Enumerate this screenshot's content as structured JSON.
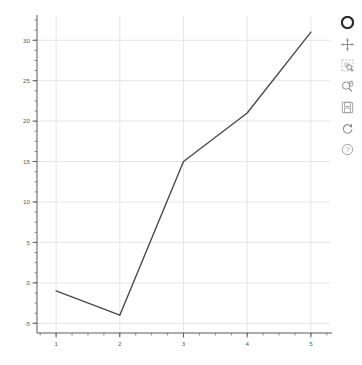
{
  "chart_data": {
    "type": "line",
    "title": "",
    "xlabel": "",
    "ylabel": "",
    "x": [
      1,
      2,
      3,
      4,
      5
    ],
    "values": [
      -1,
      -4,
      15,
      21,
      31
    ],
    "series": [
      {
        "name": "series-1",
        "values": [
          -1,
          -4,
          15,
          21,
          31
        ],
        "color": "#4a4a4a"
      }
    ],
    "xlim": [
      0.7,
      5.3
    ],
    "ylim": [
      -6.2,
      33.0
    ],
    "xticks": [
      1,
      2,
      3,
      4,
      5
    ],
    "xtick_labels": [
      "1",
      "2",
      "3",
      "4",
      "5"
    ],
    "yticks": [
      -5,
      0,
      5,
      10,
      15,
      20,
      25,
      30
    ],
    "ytick_labels": [
      "-5",
      "0",
      "5",
      "10",
      "15",
      "20",
      "25",
      "30"
    ],
    "x_minor_per_major": 4,
    "y_minor_per_major": 4,
    "grid": true,
    "grid_color": "#e5e5e5",
    "axis_color": "#5b5b5b",
    "background": "#ffffff",
    "legend": null,
    "legend_position": "none"
  },
  "toolbar": {
    "position": "right",
    "logo_name": "bokeh-logo",
    "tools": [
      {
        "name": "pan-tool",
        "label": "Pan",
        "icon": "move-cross-icon",
        "active": false
      },
      {
        "name": "box-zoom-tool",
        "label": "Box Zoom",
        "icon": "box-zoom-icon",
        "active": false
      },
      {
        "name": "wheel-zoom-tool",
        "label": "Wheel Zoom",
        "icon": "wheel-zoom-icon",
        "active": false
      },
      {
        "name": "save-tool",
        "label": "Save",
        "icon": "save-disk-icon",
        "active": false
      },
      {
        "name": "reset-tool",
        "label": "Reset",
        "icon": "reset-refresh-icon",
        "active": false
      },
      {
        "name": "help-tool",
        "label": "Help",
        "icon": "help-question-icon",
        "active": false
      }
    ]
  }
}
